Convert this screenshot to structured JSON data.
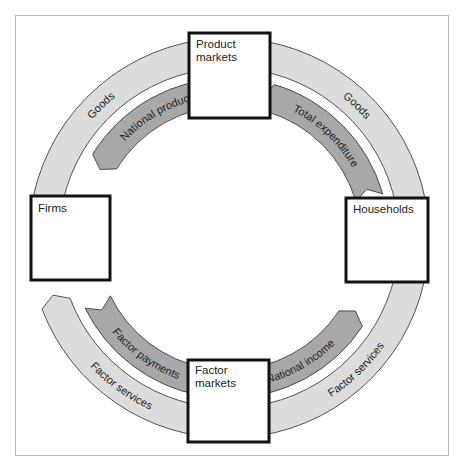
{
  "diagram": {
    "colors": {
      "goods_flow": "#dcdcdc",
      "money_flow": "#a8a8a8",
      "outline": "#2a2a2a",
      "box_border": "#111111"
    },
    "nodes": [
      {
        "id": "product-markets",
        "lines": [
          "Product",
          "markets"
        ]
      },
      {
        "id": "firms",
        "lines": [
          "Firms"
        ]
      },
      {
        "id": "households",
        "lines": [
          "Households"
        ]
      },
      {
        "id": "factor-markets",
        "lines": [
          "Factor",
          "markets"
        ]
      }
    ],
    "flows": [
      {
        "id": "goods-left",
        "label": "Goods",
        "kind": "real",
        "from": "firms",
        "to": "product-markets"
      },
      {
        "id": "goods-right",
        "label": "Goods",
        "kind": "real",
        "from": "product-markets",
        "to": "households"
      },
      {
        "id": "national-product",
        "label": "National product",
        "kind": "money",
        "from": "product-markets",
        "to": "firms"
      },
      {
        "id": "total-expenditure",
        "label": "Total expenditure",
        "kind": "money",
        "from": "households",
        "to": "product-markets"
      },
      {
        "id": "factor-payments",
        "label": "Factor payments",
        "kind": "money",
        "from": "firms",
        "to": "factor-markets"
      },
      {
        "id": "national-income",
        "label": "National income",
        "kind": "money",
        "from": "factor-markets",
        "to": "households"
      },
      {
        "id": "factor-services-left",
        "label": "Factor services",
        "kind": "real",
        "from": "factor-markets",
        "to": "firms"
      },
      {
        "id": "factor-services-right",
        "label": "Factor services",
        "kind": "real",
        "from": "households",
        "to": "factor-markets"
      }
    ]
  }
}
